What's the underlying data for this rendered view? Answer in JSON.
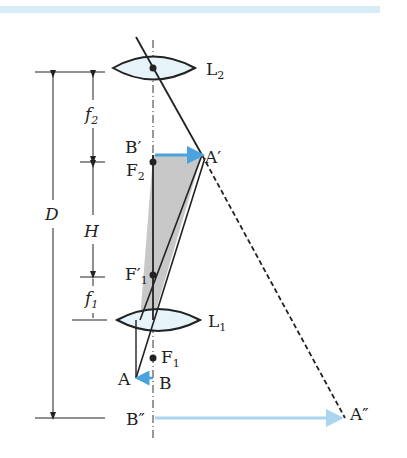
{
  "figure": {
    "colors": {
      "stroke": "#222222",
      "lens_fill": "#e6f3f8",
      "arrow_blue": "#4aa3dc",
      "arrow_light_blue": "#a9d6ee",
      "shaded_triangle": "#c8c8c8",
      "top_band": "#d8ecf7"
    },
    "lenses": [
      {
        "id": "L2",
        "label": "L",
        "sub": "2",
        "center_y": 68
      },
      {
        "id": "L1",
        "label": "L",
        "sub": "1",
        "center_y": 320
      }
    ],
    "points": {
      "B_prime": {
        "label": "B′"
      },
      "A_prime": {
        "label": "A′"
      },
      "F2": {
        "label": "F",
        "sub": "2"
      },
      "F1_prime": {
        "label": "F′",
        "sub": "1"
      },
      "F1": {
        "label": "F",
        "sub": "1"
      },
      "A": {
        "label": "A"
      },
      "B": {
        "label": "B"
      },
      "B_double_prime": {
        "label": "B″"
      },
      "A_double_prime": {
        "label": "A″"
      }
    },
    "dimensions": {
      "D": {
        "label": "D"
      },
      "f2": {
        "label": "f",
        "sub": "2"
      },
      "H": {
        "label": "H"
      },
      "f1": {
        "label": "f",
        "sub": "1"
      }
    }
  }
}
